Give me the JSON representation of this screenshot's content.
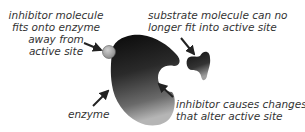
{
  "diagram": {
    "labels": {
      "inhibitor_site": [
        "inhibitor molecule",
        "fits onto enzyme",
        "away from",
        "active site"
      ],
      "substrate": [
        "substrate molecule can no",
        "longer fit into active site"
      ],
      "enzyme": "enzyme",
      "inhibitor_effect": [
        "inhibitor causes changes",
        "that alter active site"
      ]
    },
    "colors": {
      "enzyme_dark": "#111111",
      "enzyme_light": "#9a9a9a",
      "inhibitor": "#a8a8a8",
      "arrow": "#222222",
      "text": "#333333"
    }
  }
}
